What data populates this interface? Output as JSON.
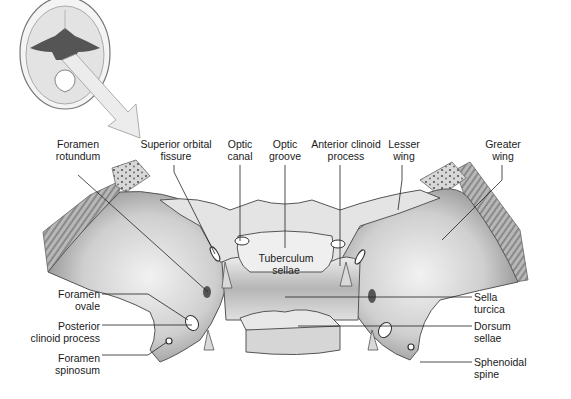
{
  "diagram": {
    "colors": {
      "background": "#ffffff",
      "bone": "#d9d9d9",
      "bone_shadow": "#9a9a9a",
      "highlight": "#555555",
      "leader": "#222222",
      "arrow": "#e6e6e6"
    },
    "labels_top": [
      {
        "id": "foramen-rotundum",
        "lines": [
          "Foramen",
          "rotundum"
        ]
      },
      {
        "id": "superior-orbital-fissure",
        "lines": [
          "Superior orbital",
          "fissure"
        ]
      },
      {
        "id": "optic-canal",
        "lines": [
          "Optic",
          "canal"
        ]
      },
      {
        "id": "optic-groove",
        "lines": [
          "Optic",
          "groove"
        ]
      },
      {
        "id": "anterior-clinoid-process",
        "lines": [
          "Anterior clinoid",
          "process"
        ]
      },
      {
        "id": "lesser-wing",
        "lines": [
          "Lesser",
          "wing"
        ]
      },
      {
        "id": "greater-wing",
        "lines": [
          "Greater",
          "wing"
        ]
      }
    ],
    "labels_left": [
      {
        "id": "foramen-ovale",
        "lines": [
          "Foramen",
          "ovale"
        ]
      },
      {
        "id": "posterior-clinoid-process",
        "lines": [
          "Posterior",
          "clinoid process"
        ]
      },
      {
        "id": "foramen-spinosum",
        "lines": [
          "Foramen",
          "spinosum"
        ]
      }
    ],
    "labels_right": [
      {
        "id": "sella-turcica",
        "lines": [
          "Sella",
          "turcica"
        ]
      },
      {
        "id": "dorsum-sellae",
        "lines": [
          "Dorsum",
          "sellae"
        ]
      },
      {
        "id": "sphenoidal-spine",
        "lines": [
          "Sphenoidal",
          "spine"
        ]
      }
    ],
    "labels_center": [
      {
        "id": "tuberculum-sellae",
        "lines": [
          "Tuberculum",
          "sellae"
        ]
      }
    ]
  }
}
